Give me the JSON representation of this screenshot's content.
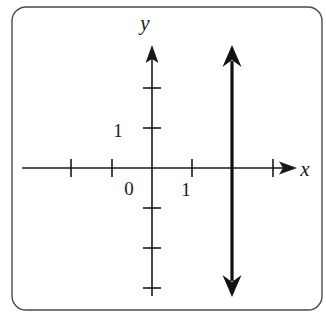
{
  "figure": {
    "name": "coordinate-plane-vertical-line",
    "background_color": "#ffffff",
    "frame": {
      "name": "rounded-border-frame",
      "stroke_color": "#4a4a4a",
      "stroke_width": 1.4,
      "corner_radius": 14,
      "x": 12,
      "y": 7,
      "width": 310,
      "height": 303
    },
    "axis_color": "#1a1a1a",
    "curve_color": "#111111"
  },
  "chart_data": {
    "type": "line",
    "title": "",
    "xlabel": "x",
    "ylabel": "y",
    "origin_label": "0",
    "grid": false,
    "legend": null,
    "xlim": [
      -2.0,
      3.6
    ],
    "ylim": [
      -3.05,
      3.1
    ],
    "unit_px": 40,
    "origin_px": {
      "x": 152,
      "y": 168
    },
    "x_axis": {
      "name": "x-axis",
      "start_px": 22,
      "end_px": 297,
      "arrow_end": "right",
      "label": "x",
      "label_px": {
        "x": 305,
        "y": 176
      },
      "ticks": [
        {
          "value": -2,
          "px": 71,
          "label": ""
        },
        {
          "value": -1,
          "px": 112,
          "label": ""
        },
        {
          "value": 1,
          "px": 192,
          "label": "1"
        },
        {
          "value": 2,
          "px": 232,
          "label": ""
        },
        {
          "value": 3,
          "px": 273,
          "label": ""
        }
      ],
      "tick_half_length": 9,
      "tick_labels": [
        {
          "text": "1",
          "px": {
            "x": 186,
            "y": 196
          }
        }
      ]
    },
    "y_axis": {
      "name": "y-axis",
      "start_px": 296,
      "end_px": 45,
      "arrow_end": "top",
      "label": "y",
      "label_px": {
        "x": 145,
        "y": 30
      },
      "ticks": [
        {
          "value": 2,
          "px": 88,
          "label": ""
        },
        {
          "value": 1,
          "px": 128,
          "label": "1"
        },
        {
          "value": -1,
          "px": 208,
          "label": ""
        },
        {
          "value": -2,
          "px": 248,
          "label": ""
        },
        {
          "value": -3,
          "px": 288,
          "label": ""
        }
      ],
      "tick_half_length": 9,
      "tick_labels": [
        {
          "text": "1",
          "px": {
            "x": 118,
            "y": 137
          }
        }
      ]
    },
    "origin_px_label": {
      "text": "0",
      "px": {
        "x": 129,
        "y": 195
      }
    },
    "series": [
      {
        "name": "vertical-line-x-equals-2",
        "equation": "x = 2",
        "type": "vertical-line",
        "x_value": 2,
        "x_px": 232,
        "y_top_px": 45,
        "y_bottom_px": 297,
        "stroke_width": 3.2,
        "arrow_start": true,
        "arrow_end": true,
        "color": "#111111"
      }
    ]
  }
}
